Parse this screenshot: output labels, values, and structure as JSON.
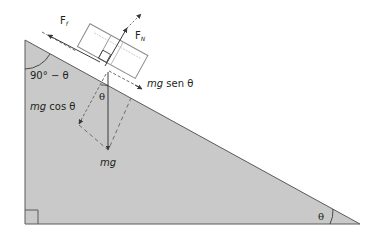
{
  "diagram": {
    "type": "inclined-plane-free-body",
    "colors": {
      "incline_fill": "#c9c9c9",
      "incline_stroke": "#5a5a5a",
      "line": "#3a3a3a",
      "dashed": "#6e6e6e",
      "block_fill": "#ffffff",
      "block_stroke": "#8a8a8a"
    },
    "labels": {
      "friction": "F",
      "friction_sub": "f",
      "normal": "F",
      "normal_sub": "N",
      "parallel_component": "mg sen θ",
      "parallel_component_mg": "mg",
      "parallel_component_rest": " sen θ",
      "perpendicular_component_mg": "mg",
      "perpendicular_component_rest": " cos θ",
      "weight": "mg",
      "top_angle": "90° − θ",
      "block_angle": "θ",
      "base_angle": "θ"
    }
  }
}
